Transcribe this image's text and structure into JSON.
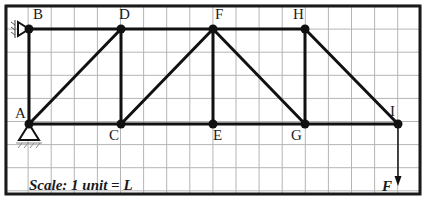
{
  "diagram": {
    "scale_label": "Scale: 1 unit = L",
    "grid": {
      "cols": 18,
      "rows": 8,
      "spacing_px": 23.1,
      "origin": [
        5,
        5
      ]
    },
    "colors": {
      "grid": "#b5b5b5",
      "frame": "#1a1a1a",
      "member": "#111111",
      "node": "#111111",
      "background": "#ffffff"
    },
    "nodes": [
      {
        "id": "A",
        "label": "A",
        "x": 29,
        "y": 124,
        "label_dx": -14,
        "label_dy": -6
      },
      {
        "id": "B",
        "label": "B",
        "x": 29,
        "y": 29,
        "label_dx": 4,
        "label_dy": -10
      },
      {
        "id": "C",
        "label": "C",
        "x": 121,
        "y": 124,
        "label_dx": -12,
        "label_dy": 16
      },
      {
        "id": "D",
        "label": "D",
        "x": 121,
        "y": 29,
        "label_dx": -2,
        "label_dy": -10
      },
      {
        "id": "E",
        "label": "E",
        "x": 213,
        "y": 124,
        "label_dx": 0,
        "label_dy": 16
      },
      {
        "id": "F",
        "label": "F",
        "x": 213,
        "y": 29,
        "label_dx": 2,
        "label_dy": -10
      },
      {
        "id": "G",
        "label": "G",
        "x": 305,
        "y": 124,
        "label_dx": -14,
        "label_dy": 16
      },
      {
        "id": "H",
        "label": "H",
        "x": 305,
        "y": 29,
        "label_dx": -12,
        "label_dy": -10
      },
      {
        "id": "I",
        "label": "I",
        "x": 398,
        "y": 124,
        "label_dx": -8,
        "label_dy": -8
      }
    ],
    "members": [
      [
        "A",
        "B"
      ],
      [
        "B",
        "D"
      ],
      [
        "D",
        "F"
      ],
      [
        "F",
        "H"
      ],
      [
        "A",
        "C"
      ],
      [
        "C",
        "E"
      ],
      [
        "E",
        "G"
      ],
      [
        "G",
        "I"
      ],
      [
        "A",
        "D"
      ],
      [
        "C",
        "D"
      ],
      [
        "C",
        "F"
      ],
      [
        "E",
        "F"
      ],
      [
        "F",
        "G"
      ],
      [
        "G",
        "H"
      ],
      [
        "H",
        "I"
      ]
    ],
    "supports": [
      {
        "node": "A",
        "type": "pin-triangle"
      },
      {
        "node": "B",
        "type": "pin-wall-left"
      }
    ],
    "load": {
      "node": "I",
      "label": "F",
      "direction": "down",
      "length_px": 60
    }
  }
}
